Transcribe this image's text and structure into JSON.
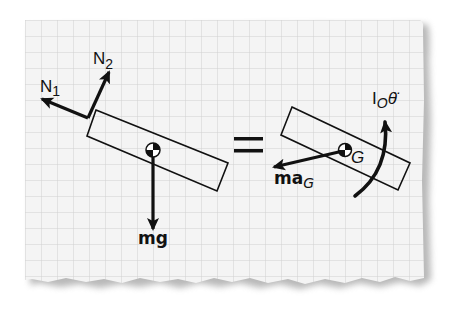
{
  "diagram": {
    "type": "free-body-diagram",
    "background": "graph paper with torn bottom edge",
    "colors": {
      "paper": "#f4f4f4",
      "grid": "#d2d2d2",
      "ink": "#111111",
      "shadow": "#9a9a9a"
    },
    "left_side": {
      "title": "free body diagram",
      "forces": [
        {
          "id": "N1",
          "label_main": "N",
          "label_sub": "1",
          "direction": "up-left"
        },
        {
          "id": "N2",
          "label_main": "N",
          "label_sub": "2",
          "direction": "up-right"
        },
        {
          "id": "mg",
          "label_main": "mg",
          "direction": "down"
        }
      ]
    },
    "operator": "=",
    "right_side": {
      "title": "kinetic diagram",
      "center_label": "G",
      "inertial_force": {
        "label_main": "ma",
        "label_sub": "G",
        "direction": "left-down"
      },
      "moment": {
        "label_main": "I",
        "label_sub": "O",
        "label_symbol": "θ̈",
        "direction": "counter-clockwise"
      }
    }
  }
}
